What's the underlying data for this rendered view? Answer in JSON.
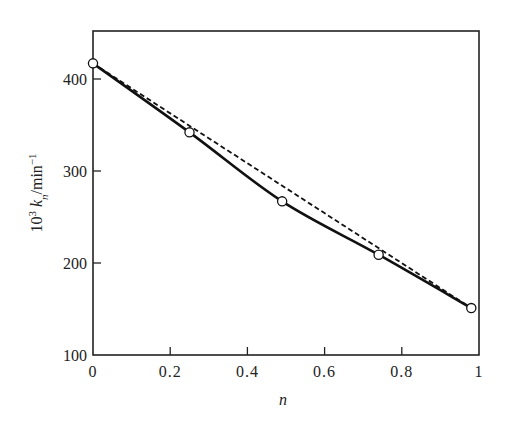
{
  "chart_data": {
    "type": "line",
    "title": "",
    "xlabel": "n",
    "ylabel": "10³ kₙ/min⁻¹",
    "ylabel_parts": {
      "prefix": "10",
      "sup": "3",
      "var": "k",
      "sub": "n",
      "unit": "/min",
      "unit_sup": "−1"
    },
    "xlim": [
      0,
      1
    ],
    "ylim": [
      100,
      450
    ],
    "xticks": [
      0,
      0.2,
      0.4,
      0.6,
      0.8,
      1
    ],
    "xtick_labels": [
      "0",
      "0.2",
      "0.4",
      "0.6",
      "0.8",
      "1"
    ],
    "yticks": [
      100,
      200,
      300,
      400
    ],
    "ytick_labels": [
      "100",
      "200",
      "300",
      "400"
    ],
    "grid": false,
    "legend": null,
    "series": [
      {
        "name": "measured",
        "style": "solid-line-with-open-circles",
        "x": [
          0,
          0.25,
          0.49,
          0.74,
          0.98
        ],
        "y": [
          417,
          342,
          267,
          209,
          151
        ]
      },
      {
        "name": "linear interpolation",
        "style": "dashed",
        "x": [
          0,
          0.98
        ],
        "y": [
          417,
          151
        ]
      }
    ]
  },
  "colors": {
    "line": "#111111",
    "axis": "#222222",
    "marker_fill": "#ffffff"
  }
}
